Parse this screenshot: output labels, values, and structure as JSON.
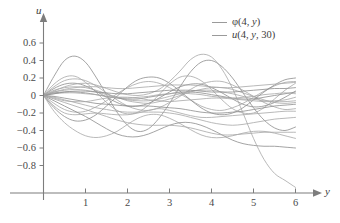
{
  "axes": {
    "x_name": "y",
    "y_name": "u",
    "x_ticks": [
      "1",
      "2",
      "3",
      "4",
      "5",
      "6"
    ],
    "y_ticks": [
      "0.6",
      "0.4",
      "0.2",
      "0",
      "-0.2",
      "-0.4",
      "-0.6",
      "-0.8"
    ]
  },
  "legend": {
    "position": "top-right",
    "entries": [
      {
        "label": "φ(4, y)",
        "color": "#9a9a9a"
      },
      {
        "label": "u(4, y, 30)",
        "color": "#9a9a9a"
      }
    ]
  },
  "style": {
    "axis_color": "#7d7d7d",
    "curve_color": "#a8a8a8",
    "curve_color_dark": "#8e8e8e",
    "background": "#ffffff"
  },
  "chart_data": {
    "type": "line",
    "title": "",
    "xlabel": "y",
    "ylabel": "u",
    "xlim": [
      0,
      6.15
    ],
    "ylim": [
      -0.98,
      0.72
    ],
    "grid": false,
    "legend_position": "top-right",
    "x_ticks": [
      1,
      2,
      3,
      4,
      5,
      6
    ],
    "y_ticks": [
      0.6,
      0.4,
      0.2,
      0,
      -0.2,
      -0.4,
      -0.6,
      -0.8
    ],
    "x": [
      0,
      0.25,
      0.5,
      0.75,
      1,
      1.25,
      1.5,
      1.75,
      2,
      2.25,
      2.5,
      2.75,
      3,
      3.25,
      3.5,
      3.75,
      4,
      4.25,
      4.5,
      4.75,
      5,
      5.25,
      5.5,
      5.75,
      6
    ],
    "series": [
      {
        "name": "curve-1",
        "values": [
          0,
          0.22,
          0.4,
          0.45,
          0.38,
          0.21,
          0.01,
          -0.19,
          -0.34,
          -0.41,
          -0.38,
          -0.26,
          -0.09,
          0.1,
          0.27,
          0.38,
          0.4,
          0.33,
          0.2,
          0.03,
          -0.14,
          -0.28,
          -0.37,
          -0.4,
          -0.36
        ]
      },
      {
        "name": "curve-2",
        "values": [
          0,
          0.13,
          0.21,
          0.22,
          0.15,
          0.04,
          -0.08,
          -0.17,
          -0.21,
          -0.19,
          -0.11,
          0.01,
          0.13,
          0.21,
          0.22,
          0.17,
          0.07,
          -0.05,
          -0.15,
          -0.2,
          -0.2,
          -0.14,
          -0.04,
          0.06,
          0.14
        ]
      },
      {
        "name": "curve-3",
        "values": [
          0,
          0.1,
          0.17,
          0.19,
          0.17,
          0.11,
          0.03,
          -0.05,
          -0.12,
          -0.16,
          -0.17,
          -0.14,
          -0.08,
          -0.01,
          0.07,
          0.13,
          0.16,
          0.16,
          0.12,
          0.06,
          -0.01,
          -0.08,
          -0.13,
          -0.16,
          -0.15
        ]
      },
      {
        "name": "curve-4",
        "values": [
          0,
          0.08,
          0.13,
          0.14,
          0.11,
          0.05,
          -0.02,
          -0.08,
          -0.12,
          -0.12,
          -0.09,
          -0.03,
          0.04,
          0.1,
          0.13,
          0.13,
          0.09,
          0.03,
          -0.04,
          -0.1,
          -0.13,
          -0.12,
          -0.08,
          -0.02,
          0.05
        ]
      },
      {
        "name": "curve-5",
        "values": [
          0,
          0.06,
          0.09,
          0.1,
          0.09,
          0.06,
          0.02,
          -0.02,
          -0.06,
          -0.08,
          -0.09,
          -0.07,
          -0.04,
          0.0,
          0.04,
          0.07,
          0.09,
          0.09,
          0.07,
          0.03,
          -0.01,
          -0.05,
          -0.08,
          -0.09,
          -0.08
        ]
      },
      {
        "name": "curve-6",
        "values": [
          0,
          0.04,
          0.06,
          0.07,
          0.06,
          0.04,
          0.01,
          -0.02,
          -0.05,
          -0.06,
          -0.06,
          -0.04,
          -0.01,
          0.02,
          0.05,
          0.06,
          0.06,
          0.04,
          0.02,
          -0.01,
          -0.04,
          -0.06,
          -0.06,
          -0.05,
          -0.02
        ]
      },
      {
        "name": "curve-7",
        "values": [
          0,
          0.03,
          0.04,
          0.04,
          0.03,
          0.01,
          -0.01,
          -0.03,
          -0.04,
          -0.04,
          -0.02,
          0.0,
          0.02,
          0.04,
          0.04,
          0.03,
          0.01,
          -0.01,
          -0.03,
          -0.04,
          -0.04,
          -0.02,
          0.0,
          0.02,
          0.04
        ]
      },
      {
        "name": "curve-8",
        "values": [
          0,
          0.02,
          0.03,
          0.03,
          0.02,
          0.01,
          -0.01,
          -0.02,
          -0.03,
          -0.02,
          -0.01,
          0.01,
          0.02,
          0.03,
          0.02,
          0.01,
          -0.01,
          -0.02,
          -0.03,
          -0.02,
          -0.01,
          0.01,
          0.02,
          0.03,
          0.02
        ]
      },
      {
        "name": "curve-9",
        "values": [
          0,
          -0.09,
          -0.16,
          -0.19,
          -0.18,
          -0.13,
          -0.06,
          0.02,
          0.09,
          0.14,
          0.16,
          0.14,
          0.09,
          0.02,
          -0.05,
          -0.12,
          -0.16,
          -0.17,
          -0.14,
          -0.09,
          -0.02,
          0.05,
          0.11,
          0.15,
          0.16
        ]
      },
      {
        "name": "curve-10",
        "values": [
          0,
          -0.14,
          -0.24,
          -0.29,
          -0.28,
          -0.22,
          -0.12,
          -0.01,
          0.1,
          0.18,
          0.21,
          0.2,
          0.14,
          0.05,
          -0.05,
          -0.14,
          -0.2,
          -0.22,
          -0.2,
          -0.14,
          -0.05,
          0.04,
          0.12,
          0.18,
          0.2
        ]
      },
      {
        "name": "curve-11",
        "values": [
          0,
          -0.12,
          -0.2,
          -0.22,
          -0.21,
          -0.2,
          -0.21,
          -0.22,
          -0.22,
          -0.2,
          -0.17,
          -0.15,
          -0.17,
          -0.2,
          -0.23,
          -0.25,
          -0.25,
          -0.24,
          -0.23,
          -0.22,
          -0.21,
          -0.2,
          -0.19,
          -0.18,
          -0.18
        ]
      },
      {
        "name": "curve-12",
        "values": [
          0,
          -0.18,
          -0.31,
          -0.4,
          -0.46,
          -0.48,
          -0.46,
          -0.41,
          -0.33,
          -0.26,
          -0.22,
          -0.22,
          -0.26,
          -0.32,
          -0.39,
          -0.45,
          -0.48,
          -0.48,
          -0.46,
          -0.43,
          -0.41,
          -0.41,
          -0.43,
          -0.46,
          -0.49
        ]
      },
      {
        "name": "curve-13",
        "values": [
          0,
          -0.06,
          -0.12,
          -0.18,
          -0.24,
          -0.31,
          -0.38,
          -0.44,
          -0.47,
          -0.47,
          -0.44,
          -0.39,
          -0.34,
          -0.31,
          -0.31,
          -0.34,
          -0.39,
          -0.45,
          -0.51,
          -0.55,
          -0.57,
          -0.58,
          -0.58,
          -0.59,
          -0.6
        ]
      },
      {
        "name": "curve-14",
        "values": [
          0,
          -0.04,
          -0.08,
          -0.12,
          -0.16,
          -0.2,
          -0.24,
          -0.28,
          -0.31,
          -0.33,
          -0.34,
          -0.34,
          -0.34,
          -0.35,
          -0.37,
          -0.4,
          -0.43,
          -0.45,
          -0.45,
          -0.44,
          -0.43,
          -0.42,
          -0.42,
          -0.42,
          -0.42
        ]
      },
      {
        "name": "curve-15",
        "values": [
          0,
          -0.02,
          -0.05,
          -0.08,
          -0.11,
          -0.14,
          -0.16,
          -0.18,
          -0.19,
          -0.19,
          -0.19,
          -0.19,
          -0.2,
          -0.22,
          -0.25,
          -0.28,
          -0.31,
          -0.33,
          -0.34,
          -0.33,
          -0.31,
          -0.29,
          -0.27,
          -0.26,
          -0.25
        ]
      },
      {
        "name": "curve-16",
        "values": [
          0,
          -0.01,
          -0.03,
          -0.05,
          -0.07,
          -0.09,
          -0.1,
          -0.11,
          -0.12,
          -0.12,
          -0.12,
          -0.13,
          -0.14,
          -0.15,
          -0.17,
          -0.19,
          -0.2,
          -0.2,
          -0.19,
          -0.18,
          -0.16,
          -0.14,
          -0.12,
          -0.11,
          -0.1
        ]
      },
      {
        "name": "curve-17-steep-drop",
        "values": [
          0,
          0.05,
          0.1,
          0.13,
          0.14,
          0.12,
          0.08,
          0.04,
          0.01,
          0.0,
          0.02,
          0.07,
          0.16,
          0.28,
          0.41,
          0.47,
          0.44,
          0.3,
          0.08,
          -0.2,
          -0.49,
          -0.73,
          -0.89,
          -0.97,
          -1.05
        ]
      },
      {
        "name": "curve-18",
        "values": [
          0,
          0.04,
          0.07,
          0.09,
          0.1,
          0.1,
          0.09,
          0.08,
          0.08,
          0.09,
          0.1,
          0.11,
          0.12,
          0.12,
          0.12,
          0.11,
          0.1,
          0.09,
          0.09,
          0.1,
          0.11,
          0.12,
          0.13,
          0.14,
          0.15
        ]
      },
      {
        "name": "curve-19",
        "values": [
          0,
          0.02,
          0.04,
          0.05,
          0.05,
          0.04,
          0.03,
          0.02,
          0.02,
          0.03,
          0.04,
          0.05,
          0.06,
          0.06,
          0.06,
          0.05,
          0.04,
          0.04,
          0.04,
          0.05,
          0.06,
          0.07,
          0.08,
          0.08,
          0.09
        ]
      },
      {
        "name": "curve-20",
        "values": [
          0,
          -0.03,
          -0.06,
          -0.07,
          -0.07,
          -0.05,
          -0.03,
          -0.02,
          -0.02,
          -0.03,
          -0.05,
          -0.06,
          -0.07,
          -0.06,
          -0.05,
          -0.04,
          -0.03,
          -0.03,
          -0.04,
          -0.05,
          -0.06,
          -0.07,
          -0.07,
          -0.07,
          -0.06
        ]
      }
    ]
  }
}
